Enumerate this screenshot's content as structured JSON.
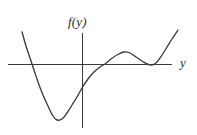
{
  "figure": {
    "title": "",
    "background_color": "#ffffff",
    "width": 197,
    "height": 135,
    "vertical_axis_label": "f(y)",
    "horizontal_axis_label": "y"
  },
  "chart_data": {
    "type": "line",
    "title": "",
    "xlabel": "y",
    "ylabel": "f(y)",
    "grid": false,
    "legend": false,
    "axis_colors": {
      "axis": "#3a3a3a",
      "curve": "#3c3a3a"
    },
    "axes": {
      "horizontal_axis_pixel_y": 64,
      "horizontal_axis_pixel_x_start": 8,
      "horizontal_axis_pixel_x_end": 172,
      "vertical_axis_pixel_x": 82,
      "vertical_axis_pixel_y_start": 33,
      "vertical_axis_pixel_y_end": 128
    },
    "zero_crossings_pixel_x": [
      32,
      105,
      152
    ],
    "features": [
      {
        "name": "left-endpoint",
        "x": 22,
        "y": 32,
        "kind": "endpoint"
      },
      {
        "name": "first-root",
        "x": 32,
        "y": 64,
        "kind": "root"
      },
      {
        "name": "global-minimum",
        "x": 55,
        "y": 120,
        "kind": "minimum"
      },
      {
        "name": "vertical-axis-crossing",
        "x": 82,
        "y": 88,
        "kind": "crossing"
      },
      {
        "name": "second-root",
        "x": 105,
        "y": 64,
        "kind": "root"
      },
      {
        "name": "local-maximum",
        "x": 124,
        "y": 52,
        "kind": "maximum"
      },
      {
        "name": "tangent-root",
        "x": 152,
        "y": 65,
        "kind": "double-root"
      },
      {
        "name": "right-endpoint",
        "x": 178,
        "y": 30,
        "kind": "endpoint"
      }
    ],
    "curve_points": [
      [
        22,
        32
      ],
      [
        26,
        46
      ],
      [
        30,
        58
      ],
      [
        34,
        70
      ],
      [
        38,
        82
      ],
      [
        43,
        95
      ],
      [
        48,
        106
      ],
      [
        53,
        116
      ],
      [
        57,
        120
      ],
      [
        62,
        119
      ],
      [
        67,
        113
      ],
      [
        72,
        105
      ],
      [
        77,
        97
      ],
      [
        82,
        88
      ],
      [
        88,
        79
      ],
      [
        94,
        72
      ],
      [
        100,
        67
      ],
      [
        105,
        64
      ],
      [
        111,
        59
      ],
      [
        117,
        55
      ],
      [
        124,
        52
      ],
      [
        130,
        53
      ],
      [
        136,
        57
      ],
      [
        142,
        61
      ],
      [
        147,
        64
      ],
      [
        152,
        65
      ],
      [
        157,
        62
      ],
      [
        162,
        55
      ],
      [
        167,
        47
      ],
      [
        172,
        39
      ],
      [
        178,
        30
      ]
    ]
  }
}
